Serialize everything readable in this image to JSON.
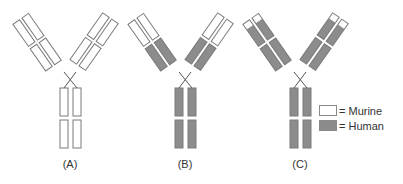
{
  "colors": {
    "murine": "#ffffff",
    "human": "#8c8c8c",
    "stroke": "#7a7a7a"
  },
  "panels": [
    {
      "id": "A",
      "label": "(A)",
      "description": "Murine antibody",
      "offset_x": 0,
      "variable": "murine",
      "constant": "murine",
      "tip_only_murine": false
    },
    {
      "id": "B",
      "label": "(B)",
      "description": "Chimeric antibody",
      "offset_x": 115,
      "variable": "murine",
      "constant": "human",
      "tip_only_murine": false
    },
    {
      "id": "C",
      "label": "(C)",
      "description": "Humanized antibody",
      "offset_x": 230,
      "variable": "human",
      "constant": "human",
      "tip_only_murine": true
    }
  ],
  "legend": {
    "items": [
      {
        "label": "= Murine",
        "color": "#ffffff"
      },
      {
        "label": "= Human",
        "color": "#8c8c8c"
      }
    ]
  }
}
